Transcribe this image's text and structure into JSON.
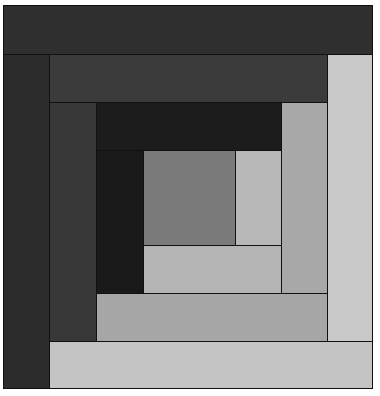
{
  "figure": {
    "type": "log-cabin-quilt-block"
  },
  "colors": {
    "outline": "#111111",
    "center": "#7a7a7a",
    "ring1_right": "#b8b8b8",
    "ring1_bottom": "#b4b4b4",
    "ring2_top": "#1c1c1c",
    "ring2_left": "#191919",
    "ring2_right": "#a8a8a8",
    "ring2_bottom": "#a6a6a6",
    "ring3_top": "#3b3b3b",
    "ring3_left": "#383838",
    "ring3_right": "#c8c8c8",
    "ring3_bottom": "#c4c4c4",
    "ring4_top": "#2f2f2f",
    "ring4_left": "#2c2c2c"
  },
  "logs": [
    {
      "name": "ring4-top",
      "x": 3,
      "y": 5,
      "w": 370,
      "h": 50,
      "color": "ring4_top"
    },
    {
      "name": "ring4-left",
      "x": 3,
      "y": 54,
      "w": 47,
      "h": 335,
      "color": "ring4_left"
    },
    {
      "name": "ring3-top",
      "x": 49,
      "y": 54,
      "w": 279,
      "h": 49,
      "color": "ring3_top"
    },
    {
      "name": "ring3-right",
      "x": 327,
      "y": 54,
      "w": 46,
      "h": 288,
      "color": "ring3_right"
    },
    {
      "name": "ring3-left",
      "x": 49,
      "y": 102,
      "w": 48,
      "h": 240,
      "color": "ring3_left"
    },
    {
      "name": "ring3-bottom",
      "x": 49,
      "y": 341,
      "w": 324,
      "h": 48,
      "color": "ring3_bottom"
    },
    {
      "name": "ring2-top",
      "x": 96,
      "y": 102,
      "w": 186,
      "h": 49,
      "color": "ring2_top"
    },
    {
      "name": "ring2-right",
      "x": 281,
      "y": 102,
      "w": 47,
      "h": 192,
      "color": "ring2_right"
    },
    {
      "name": "ring2-left",
      "x": 96,
      "y": 150,
      "w": 48,
      "h": 144,
      "color": "ring2_left"
    },
    {
      "name": "ring2-bottom",
      "x": 96,
      "y": 293,
      "w": 232,
      "h": 49,
      "color": "ring2_bottom"
    },
    {
      "name": "center-square",
      "x": 143,
      "y": 150,
      "w": 93,
      "h": 96,
      "color": "center"
    },
    {
      "name": "ring1-right",
      "x": 235,
      "y": 150,
      "w": 47,
      "h": 96,
      "color": "ring1_right"
    },
    {
      "name": "ring1-bottom",
      "x": 143,
      "y": 245,
      "w": 139,
      "h": 49,
      "color": "ring1_bottom"
    }
  ]
}
